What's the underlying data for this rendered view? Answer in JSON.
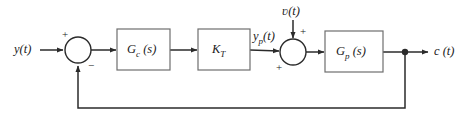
{
  "diagram": {
    "type": "control-system-block-diagram",
    "canvas": {
      "width": 461,
      "height": 125
    },
    "colors": {
      "background": "#ffffff",
      "line": "#2b2b2b",
      "block_stroke": "#6e6e6e",
      "text": "#1a1a1a"
    },
    "signals": {
      "reference_input": "y(t)",
      "reference_input_base": "y",
      "reference_input_arg": "(t)",
      "disturbance_input_base": "ʋ",
      "disturbance_input_arg": "(t)",
      "plant_input_base": "y",
      "plant_input_sub": "p",
      "plant_input_arg": "(t)",
      "output_base": "c",
      "output_arg": "(t)"
    },
    "blocks": [
      {
        "id": "controller",
        "base": "G",
        "subscript": "c",
        "arg": "(s)",
        "label": "G c (s)",
        "x": 117,
        "y": 29,
        "width": 53,
        "height": 41
      },
      {
        "id": "gain",
        "base": "K",
        "subscript": "T",
        "arg": "",
        "label": "K T",
        "x": 198,
        "y": 29,
        "width": 52,
        "height": 41
      },
      {
        "id": "plant",
        "base": "G",
        "subscript": "p",
        "arg": "(s)",
        "label": "G p (s)",
        "x": 325,
        "y": 31,
        "width": 58,
        "height": 41
      }
    ],
    "summing_junctions": [
      {
        "id": "error-summer",
        "cx": 78,
        "cy": 50,
        "r": 13,
        "signs": [
          {
            "symbol": "+",
            "position": "top-left"
          },
          {
            "symbol": "−",
            "position": "bottom-right"
          }
        ]
      },
      {
        "id": "disturbance-summer",
        "cx": 293,
        "cy": 52,
        "r": 13,
        "signs": [
          {
            "symbol": "+",
            "position": "top-right"
          },
          {
            "symbol": "+",
            "position": "bottom-left"
          }
        ]
      }
    ],
    "nodes": [
      {
        "id": "output-takeoff",
        "cx": 405,
        "cy": 52,
        "r": 3
      }
    ],
    "feedback": {
      "from_x": 405,
      "to_x": 78,
      "bus_y": 108,
      "description": "unity feedback from output takeoff to negative input of error summer"
    }
  }
}
